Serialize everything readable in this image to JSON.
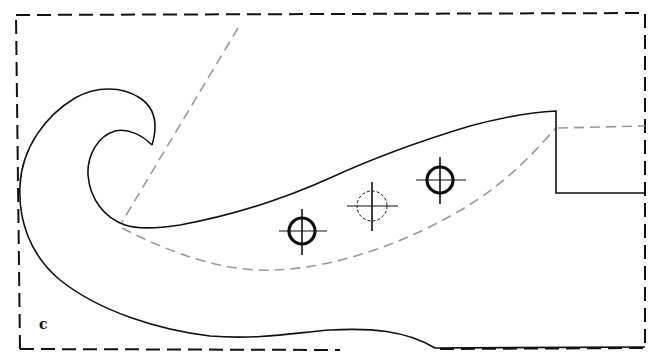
{
  "figure": {
    "label": "c",
    "colors": {
      "outline": "#111111",
      "construction_line": "#9a9a9a",
      "background": "#ffffff"
    },
    "holes": [
      {
        "name": "hole-left",
        "style": "solid",
        "cx": 302,
        "cy": 231
      },
      {
        "name": "hole-center",
        "style": "dashed",
        "cx": 370,
        "cy": 206
      },
      {
        "name": "hole-right",
        "style": "solid",
        "cx": 440,
        "cy": 180
      }
    ]
  }
}
